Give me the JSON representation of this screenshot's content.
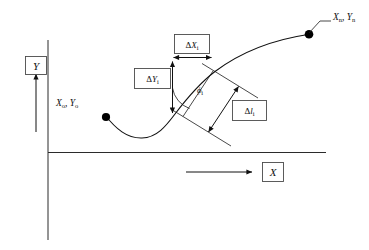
{
  "figure": {
    "background_color": "#ffffff",
    "line_color": "#111111",
    "box_border_color": "#4a4a4a"
  },
  "axes": {
    "y": {
      "label": "Y",
      "arrow_direction": "up",
      "axis_line": "vertical"
    },
    "x": {
      "label": "X",
      "arrow_direction": "right",
      "axis_line": "horizontal"
    }
  },
  "points": [
    {
      "id": "start",
      "label_x": "X",
      "label_x_sub": "o",
      "label_y": "Y",
      "label_y_sub": "o",
      "separator": ", ",
      "full_label": "Xo, Yo"
    },
    {
      "id": "end",
      "label_x": "X",
      "label_x_sub": "n",
      "label_y": "Y",
      "label_y_sub": "n",
      "separator": ", ",
      "full_label": "Xn, Yn"
    }
  ],
  "dimensions": [
    {
      "id": "delta-x",
      "symbol": "Δ",
      "variable": "X",
      "subscript": "i",
      "full_label": "ΔXi",
      "orientation": "horizontal"
    },
    {
      "id": "delta-y",
      "symbol": "Δ",
      "variable": "Y",
      "subscript": "i",
      "full_label": "ΔYi",
      "orientation": "vertical"
    },
    {
      "id": "delta-l",
      "symbol": "Δ",
      "variable": "l",
      "subscript": "i",
      "full_label": "Δli",
      "orientation": "chord"
    }
  ],
  "angle": {
    "id": "phi",
    "symbol": "ϕ",
    "subscript": "i",
    "full_label": "ϕi",
    "measured_from": "vertical"
  }
}
